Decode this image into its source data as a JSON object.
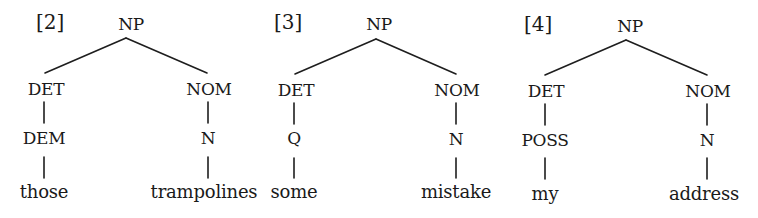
{
  "trees": [
    {
      "number": "[2]",
      "root": "NP",
      "left": {
        "cat": "DET",
        "sub": "DEM",
        "word": "those"
      },
      "right": {
        "cat": "NOM",
        "sub": "N",
        "word": "trampolines"
      }
    },
    {
      "number": "[3]",
      "root": "NP",
      "left": {
        "cat": "DET",
        "sub": "Q",
        "word": "some"
      },
      "right": {
        "cat": "NOM",
        "sub": "N",
        "word": "mistake"
      }
    },
    {
      "number": "[4]",
      "root": "NP",
      "left": {
        "cat": "DET",
        "sub": "POSS",
        "word": "my"
      },
      "right": {
        "cat": "NOM",
        "sub": "N",
        "word": "address"
      }
    }
  ]
}
